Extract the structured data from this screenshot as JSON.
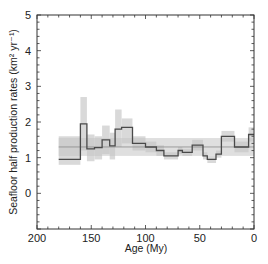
{
  "chart_data": {
    "type": "line",
    "title": "",
    "xlabel": "Age (My)",
    "ylabel": "Seafloor half production rates (km² yr⁻¹)",
    "xlim": [
      200,
      0
    ],
    "ylim": [
      -1,
      5
    ],
    "xticks": [
      200,
      150,
      100,
      50,
      0
    ],
    "yticks": [
      0,
      1,
      2,
      3,
      4,
      5
    ],
    "grid": false,
    "legend": null,
    "mean_line": 1.3,
    "mean_band": [
      1.05,
      1.55
    ],
    "series": [
      {
        "name": "half production rate (step)",
        "style": "step",
        "bins": [
          {
            "from": 180,
            "to": 160,
            "value": 0.95,
            "low": 0.8,
            "high": 1.6
          },
          {
            "from": 160,
            "to": 154,
            "value": 1.95,
            "low": 1.2,
            "high": 2.7
          },
          {
            "from": 154,
            "to": 147,
            "value": 1.25,
            "low": 0.9,
            "high": 1.65
          },
          {
            "from": 147,
            "to": 140,
            "value": 1.28,
            "low": 0.95,
            "high": 1.6
          },
          {
            "from": 140,
            "to": 133,
            "value": 1.5,
            "low": 1.1,
            "high": 1.9
          },
          {
            "from": 133,
            "to": 128,
            "value": 1.33,
            "low": 0.95,
            "high": 1.7
          },
          {
            "from": 128,
            "to": 122,
            "value": 1.8,
            "low": 1.3,
            "high": 2.35
          },
          {
            "from": 122,
            "to": 112,
            "value": 1.85,
            "low": 1.4,
            "high": 2.1
          },
          {
            "from": 112,
            "to": 100,
            "value": 1.4,
            "low": 1.2,
            "high": 1.6
          },
          {
            "from": 100,
            "to": 90,
            "value": 1.3,
            "low": 1.15,
            "high": 1.45
          },
          {
            "from": 90,
            "to": 83,
            "value": 1.2,
            "low": 1.05,
            "high": 1.35
          },
          {
            "from": 83,
            "to": 70,
            "value": 1.05,
            "low": 0.95,
            "high": 1.15
          },
          {
            "from": 70,
            "to": 66,
            "value": 1.2,
            "low": 1.1,
            "high": 1.3
          },
          {
            "from": 66,
            "to": 57,
            "value": 1.15,
            "low": 1.05,
            "high": 1.25
          },
          {
            "from": 57,
            "to": 47,
            "value": 1.35,
            "low": 1.2,
            "high": 1.5
          },
          {
            "from": 47,
            "to": 43,
            "value": 1.05,
            "low": 0.95,
            "high": 1.15
          },
          {
            "from": 43,
            "to": 35,
            "value": 0.95,
            "low": 0.85,
            "high": 1.05
          },
          {
            "from": 35,
            "to": 30,
            "value": 1.1,
            "low": 1.0,
            "high": 1.2
          },
          {
            "from": 30,
            "to": 18,
            "value": 1.6,
            "low": 1.45,
            "high": 1.75
          },
          {
            "from": 18,
            "to": 5,
            "value": 1.3,
            "low": 1.15,
            "high": 1.45
          },
          {
            "from": 5,
            "to": 0,
            "value": 1.65,
            "low": 1.45,
            "high": 1.85
          }
        ]
      }
    ]
  },
  "axes": {
    "x_label": "Age (My)",
    "y_label": "Seafloor half production rates (km² yr⁻¹)",
    "x_ticks": [
      "200",
      "150",
      "100",
      "50",
      "0"
    ],
    "y_ticks": [
      "0",
      "1",
      "2",
      "3",
      "4",
      "5"
    ]
  },
  "colors": {
    "line": "#4a4a4a",
    "band_outer": "#d9d9d9",
    "band_inner": "#c4c4c4",
    "mean_band": "#e2e2e2",
    "axis": "#333333"
  }
}
